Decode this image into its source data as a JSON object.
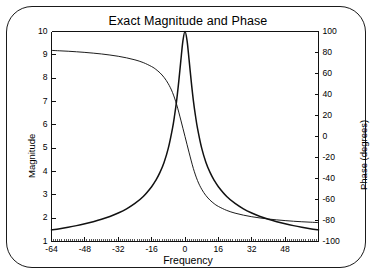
{
  "chart_data": {
    "type": "line",
    "title": "Exact Magnitude and Phase",
    "xlabel": "Frequency",
    "ylabel": "Magnitude",
    "y2label": "Phase (degrees)",
    "xlim": [
      -64,
      64
    ],
    "ylim": [
      1,
      10
    ],
    "y2lim": [
      -100,
      100
    ],
    "grid": false,
    "legend": null,
    "xticks": [
      -64,
      -48,
      -32,
      -16,
      0,
      16,
      32,
      48
    ],
    "xtick_labels": [
      "-64",
      "-48",
      "-32",
      "-16",
      "0",
      "16",
      "32",
      "48"
    ],
    "yticks": [
      1,
      2,
      3,
      4,
      5,
      6,
      7,
      8,
      9,
      10
    ],
    "ytick_labels": [
      "1",
      "2",
      "3",
      "4",
      "5",
      "6",
      "7",
      "8",
      "9",
      "10"
    ],
    "y2ticks": [
      -100,
      -80,
      -60,
      -40,
      -20,
      0,
      20,
      40,
      60,
      80,
      100
    ],
    "y2tick_labels": [
      "-100",
      "-80",
      "-60",
      "-40",
      "-20",
      "0",
      "20",
      "40",
      "60",
      "80",
      "100"
    ],
    "minor_xticks": true,
    "series": [
      {
        "name": "Magnitude",
        "axis": "left",
        "x": [
          -64,
          -60,
          -56,
          -52,
          -48,
          -44,
          -40,
          -36,
          -32,
          -28,
          -24,
          -20,
          -16,
          -14,
          -12,
          -10,
          -8,
          -6,
          -5,
          -4,
          -3,
          -2,
          -1,
          0,
          1,
          2,
          3,
          4,
          5,
          6,
          8,
          10,
          12,
          14,
          16,
          20,
          24,
          28,
          32,
          36,
          40,
          44,
          48,
          52,
          56,
          60,
          64
        ],
        "values": [
          1.5,
          1.55,
          1.61,
          1.68,
          1.76,
          1.85,
          1.95,
          2.07,
          2.22,
          2.4,
          2.63,
          2.93,
          3.35,
          3.62,
          3.96,
          4.4,
          5.0,
          5.85,
          6.4,
          7.05,
          7.85,
          8.75,
          9.6,
          10.0,
          9.6,
          8.75,
          7.85,
          7.05,
          6.4,
          5.85,
          5.0,
          4.4,
          3.96,
          3.62,
          3.35,
          2.93,
          2.63,
          2.4,
          2.22,
          2.07,
          1.95,
          1.85,
          1.76,
          1.68,
          1.61,
          1.55,
          1.5
        ]
      },
      {
        "name": "Phase",
        "axis": "right",
        "x": [
          -64,
          -60,
          -56,
          -52,
          -48,
          -44,
          -40,
          -36,
          -32,
          -28,
          -24,
          -20,
          -16,
          -14,
          -12,
          -10,
          -8,
          -6,
          -4,
          -2,
          0,
          2,
          4,
          6,
          8,
          10,
          12,
          14,
          16,
          20,
          24,
          28,
          32,
          36,
          40,
          44,
          48,
          52,
          56,
          60,
          64
        ],
        "values": [
          82.0,
          81.6,
          81.2,
          80.7,
          80.1,
          79.4,
          78.6,
          77.6,
          76.4,
          74.9,
          73.0,
          70.4,
          66.6,
          64.0,
          60.6,
          56.2,
          50.2,
          42.0,
          30.4,
          15.6,
          0.0,
          -15.6,
          -30.4,
          -42.0,
          -50.2,
          -56.2,
          -60.6,
          -64.0,
          -66.6,
          -70.4,
          -73.0,
          -74.9,
          -76.4,
          -77.6,
          -78.6,
          -79.4,
          -80.1,
          -80.7,
          -81.2,
          -81.6,
          -82.0
        ]
      }
    ]
  }
}
